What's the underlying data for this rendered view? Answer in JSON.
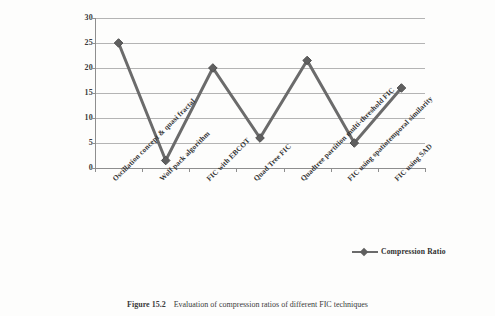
{
  "figure": {
    "caption_label": "Figure 15.2",
    "caption_text": "Evaluation of compression ratios of different FIC techniques"
  },
  "legend": {
    "position": "bottom-right",
    "entries": [
      {
        "label": "Compression Ratio",
        "color": "#6b6b6b",
        "marker": "diamond"
      }
    ]
  },
  "chart_data": {
    "type": "line",
    "title": "",
    "xlabel": "",
    "ylabel": "",
    "ylim": [
      0,
      30
    ],
    "ytick_step": 5,
    "yticks": [
      "0",
      "5",
      "10",
      "15",
      "20",
      "25",
      "30"
    ],
    "grid": true,
    "grid_axis": "y",
    "legend_position": "bottom-right",
    "marker": "diamond",
    "line_color": "#6b6b6b",
    "categories": [
      "Oscillation concept & quasi fractal",
      "Wolf pack algorithm",
      "FIC with EBCOT",
      "Quad Tree FIC",
      "Quadtree partition multi-threshold FIC",
      "FIC using spatiotemporal similarity",
      "FIC using SAD"
    ],
    "series": [
      {
        "name": "Compression Ratio",
        "values": [
          25,
          1.5,
          20,
          6,
          21.5,
          5,
          16
        ]
      }
    ]
  }
}
